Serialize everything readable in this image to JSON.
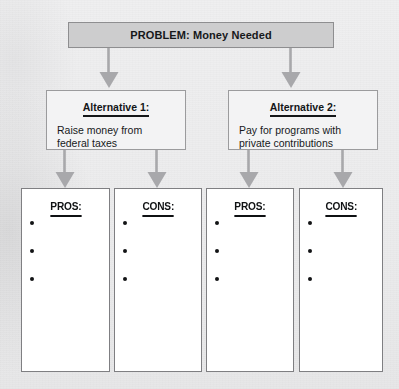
{
  "diagram": {
    "title": "PROBLEM: Money Needed",
    "problem": {
      "label": "PROBLEM: Money Needed"
    },
    "alternatives": [
      {
        "heading": "Alternative 1:",
        "body_line1": "Raise money from",
        "body_line2": "federal taxes",
        "columns": [
          {
            "heading": "PROS:",
            "bullet_count": 3
          },
          {
            "heading": "CONS:",
            "bullet_count": 3
          }
        ]
      },
      {
        "heading": "Alternative 2:",
        "body_line1": "Pay for programs with",
        "body_line2": "private contributions",
        "columns": [
          {
            "heading": "PROS:",
            "bullet_count": 3
          },
          {
            "heading": "CONS:",
            "bullet_count": 3
          }
        ]
      }
    ],
    "colors": {
      "problem_fill": "#cdcdce",
      "problem_border": "#8e8e90",
      "alt_fill": "#f3f3f4",
      "alt_border": "#9b9b9d",
      "column_fill": "#ffffff",
      "column_border": "#7f7f82",
      "arrow": "#a8a8ab",
      "text": "#16181a",
      "page_background": "#ececed"
    }
  }
}
